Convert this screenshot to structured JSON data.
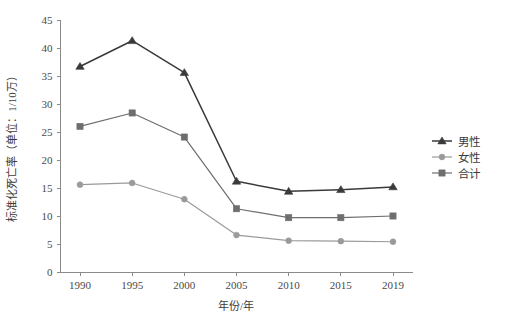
{
  "chart_data": {
    "type": "line",
    "title": "",
    "xlabel": "年份/年",
    "ylabel": "标准化死亡率（单位：1/10万）",
    "categories": [
      "1990",
      "1995",
      "2000",
      "2005",
      "2010",
      "2015",
      "2019"
    ],
    "x": [
      1990,
      1995,
      2000,
      2005,
      2010,
      2015,
      2019
    ],
    "series": [
      {
        "name": "男性",
        "marker": "triangle",
        "color": "#3a3a3a",
        "values": [
          36.7,
          41.3,
          35.6,
          16.2,
          14.4,
          14.7,
          15.2
        ]
      },
      {
        "name": "女性",
        "marker": "circle",
        "color": "#9a9a9a",
        "values": [
          15.6,
          15.9,
          13.0,
          6.6,
          5.6,
          5.5,
          5.4
        ]
      },
      {
        "name": "合计",
        "marker": "square",
        "color": "#6e6e6e",
        "values": [
          26.0,
          28.4,
          24.1,
          11.3,
          9.7,
          9.7,
          10.0
        ]
      }
    ],
    "ylim": [
      0,
      45
    ],
    "yticks": [
      0,
      5,
      10,
      15,
      20,
      25,
      30,
      35,
      40,
      45
    ],
    "ytick_labels": [
      "0",
      "5",
      "10",
      "15",
      "20",
      "25",
      "30",
      "35",
      "40",
      "45"
    ],
    "grid": false,
    "legend_position": "right"
  },
  "legend": {
    "items": [
      {
        "label": "男性"
      },
      {
        "label": "女性"
      },
      {
        "label": "合计"
      }
    ]
  },
  "axes": {
    "y_title": "标准化死亡率（单位：1/10万）",
    "x_title": "年份/年"
  }
}
